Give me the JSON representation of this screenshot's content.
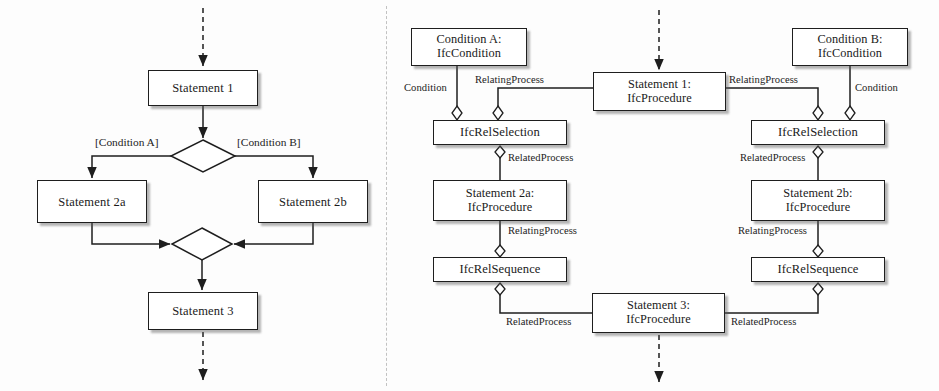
{
  "figure": {
    "left_panel_title": "",
    "right_panel_title": "",
    "divider_x": 386
  },
  "flowchart": {
    "nodes": [
      {
        "id": "stmt1",
        "label": "Statement 1",
        "x": 148,
        "y": 70,
        "w": 110,
        "h": 36
      },
      {
        "id": "stmt2a",
        "label": "Statement 2a",
        "x": 37,
        "y": 180,
        "w": 110,
        "h": 43
      },
      {
        "id": "stmt2b",
        "label": "Statement 2b",
        "x": 258,
        "y": 180,
        "w": 110,
        "h": 43
      },
      {
        "id": "stmt3",
        "label": "Statement 3",
        "x": 148,
        "y": 292,
        "w": 110,
        "h": 38
      }
    ],
    "decisions": [
      {
        "id": "branch",
        "cx": 203,
        "cy": 156,
        "rx": 32,
        "ry": 16
      },
      {
        "id": "merge",
        "cx": 202,
        "cy": 244,
        "rx": 30,
        "ry": 16
      }
    ],
    "guards": [
      {
        "id": "guard-a",
        "label": "[Condition A]",
        "x": 95,
        "y": 136
      },
      {
        "id": "guard-b",
        "label": "[Condition B]",
        "x": 237,
        "y": 136
      }
    ],
    "entry_arrow": {
      "x": 203,
      "y_from": 8,
      "y_to": 68,
      "style": "dashed"
    },
    "exit_arrow": {
      "x": 203,
      "y_from": 332,
      "y_to": 382,
      "style": "dashed"
    }
  },
  "ifc_model": {
    "nodes": [
      {
        "id": "condA",
        "label": "Condition A:\nIfcCondition",
        "x": 411,
        "y": 28,
        "w": 116,
        "h": 38,
        "kind": "object"
      },
      {
        "id": "condB",
        "label": "Condition B:\nIfcCondition",
        "x": 792,
        "y": 28,
        "w": 116,
        "h": 38,
        "kind": "object"
      },
      {
        "id": "proc1",
        "label": "Statement 1:\nIfcProcedure",
        "x": 593,
        "y": 72,
        "w": 133,
        "h": 39,
        "kind": "object"
      },
      {
        "id": "selA",
        "label": "IfcRelSelection",
        "x": 433,
        "y": 120,
        "w": 134,
        "h": 25,
        "kind": "relation"
      },
      {
        "id": "selB",
        "label": "IfcRelSelection",
        "x": 751,
        "y": 120,
        "w": 134,
        "h": 25,
        "kind": "relation"
      },
      {
        "id": "proc2a",
        "label": "Statement 2a:\nIfcProcedure",
        "x": 433,
        "y": 180,
        "w": 134,
        "h": 41,
        "kind": "object"
      },
      {
        "id": "proc2b",
        "label": "Statement 2b:\nIfcProcedure",
        "x": 751,
        "y": 180,
        "w": 134,
        "h": 41,
        "kind": "object"
      },
      {
        "id": "seqA",
        "label": "IfcRelSequence",
        "x": 433,
        "y": 257,
        "w": 134,
        "h": 25,
        "kind": "relation"
      },
      {
        "id": "seqB",
        "label": "IfcRelSequence",
        "x": 751,
        "y": 257,
        "w": 134,
        "h": 25,
        "kind": "relation"
      },
      {
        "id": "proc3",
        "label": "Statement 3:\nIfcProcedure",
        "x": 592,
        "y": 293,
        "w": 133,
        "h": 40,
        "kind": "object"
      }
    ],
    "edge_labels": [
      {
        "id": "condA-role",
        "label": "Condition",
        "x": 404,
        "y": 82
      },
      {
        "id": "relprocA-role",
        "label": "RelatingProcess",
        "x": 475,
        "y": 74
      },
      {
        "id": "relatedA-role",
        "label": "RelatedProcess",
        "x": 508,
        "y": 161
      },
      {
        "id": "relatingA2",
        "label": "RelatingProcess",
        "x": 508,
        "y": 227
      },
      {
        "id": "relatedA3",
        "label": "RelatedProcess",
        "x": 506,
        "y": 316
      },
      {
        "id": "condB-role",
        "label": "Condition",
        "x": 849,
        "y": 82
      },
      {
        "id": "relprocB-role",
        "label": "RelatingProcess",
        "x": 733,
        "y": 74
      },
      {
        "id": "relatedB-role",
        "label": "RelatedProcess",
        "x": 746,
        "y": 161
      },
      {
        "id": "relatingB2",
        "label": "RelatingProcess",
        "x": 744,
        "y": 227
      },
      {
        "id": "relatedB3",
        "label": "RelatedProcess",
        "x": 731,
        "y": 316
      }
    ],
    "entry_arrow": {
      "x": 659,
      "y_from": 10,
      "y_to": 70,
      "style": "dashed"
    },
    "exit_arrow": {
      "x": 659,
      "y_from": 335,
      "y_to": 384,
      "style": "dashed"
    }
  },
  "style": {
    "line_color": "#1e1e1e",
    "box_fill": "#ffffff",
    "text_color": "#1a1a1a",
    "shadow_color": "#8c8c8c",
    "divider_color": "#c2c2c2"
  }
}
